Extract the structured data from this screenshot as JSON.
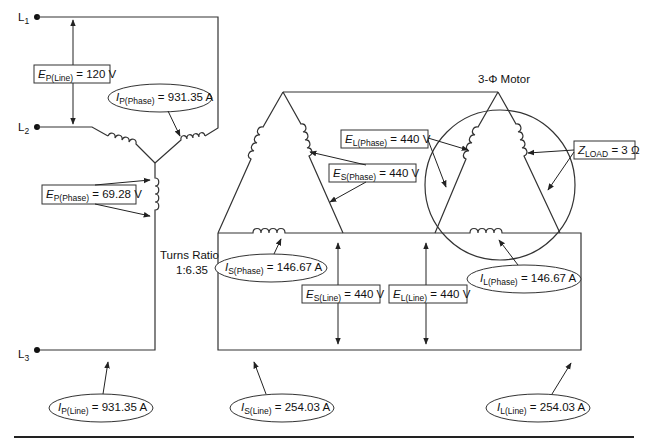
{
  "terminals": {
    "l1": {
      "letter": "L",
      "sub": "1"
    },
    "l2": {
      "letter": "L",
      "sub": "2"
    },
    "l3": {
      "letter": "L",
      "sub": "3"
    }
  },
  "labels": {
    "ep_line": {
      "sym": "E",
      "sub": "P(Line)",
      "value": " = 120 V"
    },
    "ip_phase": {
      "sym": "I",
      "sub": "P(Phase)",
      "value": " = 931.35 A"
    },
    "ep_phase": {
      "sym": "E",
      "sub": "P(Phase)",
      "value": " = 69.28 V"
    },
    "ip_line": {
      "sym": "I",
      "sub": "P(Line)",
      "value": " = 931.35 A"
    },
    "el_phase": {
      "sym": "E",
      "sub": "L(Phase)",
      "value": " = 440 V"
    },
    "es_phase": {
      "sym": "E",
      "sub": "S(Phase)",
      "value": " = 440 V"
    },
    "z_load": {
      "sym": "Z",
      "sub": "LOAD",
      "value": " = 3 Ω"
    },
    "is_phase": {
      "sym": "I",
      "sub": "S(Phase)",
      "value": " = 146.67 A"
    },
    "es_line": {
      "sym": "E",
      "sub": "S(Line)",
      "value": " = 440 V"
    },
    "el_line": {
      "sym": "E",
      "sub": "L(Line)",
      "value": " = 440 V"
    },
    "il_phase": {
      "sym": "I",
      "sub": "L(Phase)",
      "value": " = 146.67 A"
    },
    "is_line": {
      "sym": "I",
      "sub": "S(Line)",
      "value": " = 254.03 A"
    },
    "il_line": {
      "sym": "I",
      "sub": "L(Line)",
      "value": " = 254.03 A"
    }
  },
  "captions": {
    "motor_title": "3-Φ Motor",
    "turns_ratio_title": "Turns Ratio",
    "turns_ratio_value": "1:6.35"
  }
}
